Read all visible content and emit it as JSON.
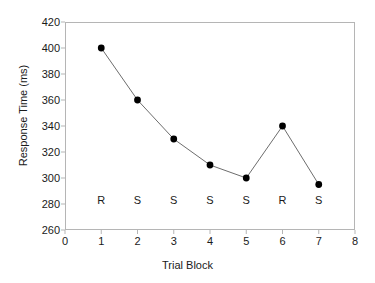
{
  "chart_data": {
    "type": "line",
    "title": "",
    "xlabel": "Trial Block",
    "ylabel": "Response Time (ms)",
    "x": [
      1,
      2,
      3,
      4,
      5,
      6,
      7
    ],
    "values": [
      400,
      360,
      330,
      310,
      300,
      340,
      295
    ],
    "series": [
      {
        "name": "Response Time",
        "values": [
          400,
          360,
          330,
          310,
          300,
          340,
          295
        ]
      }
    ],
    "point_annotations": [
      "R",
      "S",
      "S",
      "S",
      "S",
      "R",
      "S"
    ],
    "annotation_y": 283,
    "xlim": [
      0,
      8
    ],
    "ylim": [
      260,
      420
    ],
    "xticks": [
      "0",
      "1",
      "2",
      "3",
      "4",
      "5",
      "6",
      "7",
      "8"
    ],
    "yticks": [
      "260",
      "280",
      "300",
      "320",
      "340",
      "360",
      "380",
      "400",
      "420"
    ],
    "xtick_step": 1,
    "ytick_step": 20,
    "grid": false,
    "legend": false,
    "legend_position": "none",
    "marker": "filled-circle",
    "marker_color": "#000000",
    "line_color": "#6d6d6d",
    "frame_color": "#b5b5b5",
    "background": "#ffffff"
  }
}
